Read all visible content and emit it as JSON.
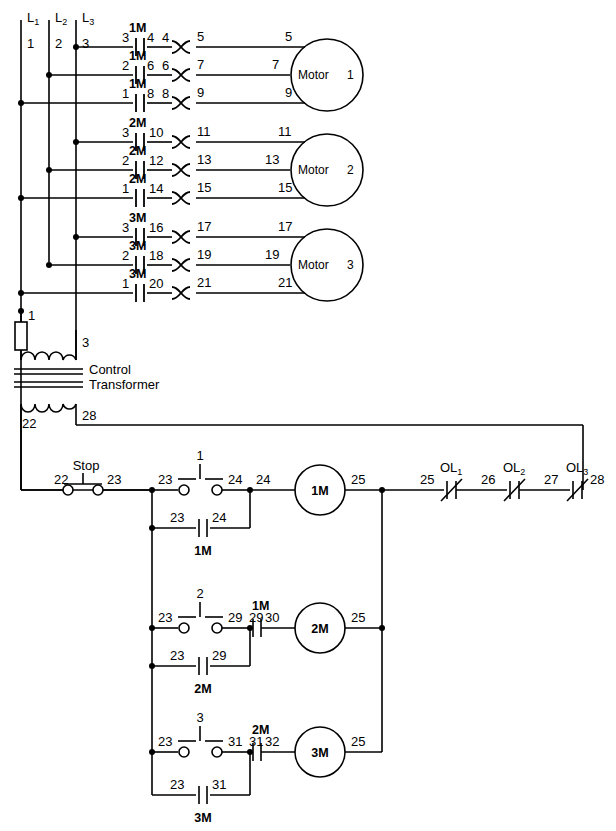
{
  "diagram": {
    "transformer_label_line1": "Control",
    "transformer_label_line2": "Transformer"
  },
  "power": {
    "lines": [
      {
        "name": "L1",
        "base": "L",
        "sub": "1",
        "wire": "1"
      },
      {
        "name": "L2",
        "base": "L",
        "sub": "2",
        "wire": "2"
      },
      {
        "name": "L3",
        "base": "L",
        "sub": "3",
        "wire": "3"
      }
    ],
    "motors": [
      {
        "name": "Motor",
        "number": "1",
        "starter": "1M",
        "phases": [
          {
            "in": "3",
            "contact": "1M",
            "mid_left": "4",
            "mid_right": "4",
            "ol_out": "5",
            "motor_in": "5"
          },
          {
            "in": "2",
            "contact": "1M",
            "mid_left": "6",
            "mid_right": "6",
            "ol_out": "7",
            "motor_in": "7"
          },
          {
            "in": "1",
            "contact": "1M",
            "mid_left": "8",
            "mid_right": "8",
            "ol_out": "9",
            "motor_in": "9"
          }
        ]
      },
      {
        "name": "Motor",
        "number": "2",
        "starter": "2M",
        "phases": [
          {
            "in": "3",
            "contact": "2M",
            "mid_left": "10",
            "mid_right": "",
            "ol_out": "11",
            "motor_in": "11"
          },
          {
            "in": "2",
            "contact": "2M",
            "mid_left": "12",
            "mid_right": "",
            "ol_out": "13",
            "motor_in": "13"
          },
          {
            "in": "1",
            "contact": "2M",
            "mid_left": "14",
            "mid_right": "",
            "ol_out": "15",
            "motor_in": "15"
          }
        ]
      },
      {
        "name": "Motor",
        "number": "3",
        "starter": "3M",
        "phases": [
          {
            "in": "3",
            "contact": "3M",
            "mid_left": "16",
            "mid_right": "",
            "ol_out": "17",
            "motor_in": "17"
          },
          {
            "in": "2",
            "contact": "3M",
            "mid_left": "18",
            "mid_right": "",
            "ol_out": "19",
            "motor_in": "19"
          },
          {
            "in": "1",
            "contact": "3M",
            "mid_left": "20",
            "mid_right": "",
            "ol_out": "21",
            "motor_in": "21"
          }
        ]
      }
    ]
  },
  "transformer": {
    "primary_left_wire": "1",
    "primary_right_wire": "3",
    "secondary_left_wire": "22",
    "secondary_right_wire": "28"
  },
  "control": {
    "stop": {
      "label": "Stop",
      "in": "22",
      "out": "23"
    },
    "rungs": [
      {
        "start_button": "1",
        "start_in": "23",
        "start_out": "24",
        "coil": "1M",
        "coil_in": "24",
        "coil_out": "25",
        "seal_in": "23",
        "seal_out": "24",
        "seal_device": "1M",
        "interlock": null,
        "interlock_in": null,
        "interlock_out": null
      },
      {
        "start_button": "2",
        "start_in": "23",
        "start_out": "29",
        "coil": "2M",
        "coil_in": "30",
        "coil_out": "25",
        "seal_in": "23",
        "seal_out": "29",
        "seal_device": "2M",
        "interlock": "1M",
        "interlock_in": "29",
        "interlock_out": "30"
      },
      {
        "start_button": "3",
        "start_in": "23",
        "start_out": "31",
        "coil": "3M",
        "coil_in": "32",
        "coil_out": "25",
        "seal_in": "23",
        "seal_out": "31",
        "seal_device": "3M",
        "interlock": "2M",
        "interlock_in": "31",
        "interlock_out": "32"
      }
    ],
    "overloads": [
      {
        "base": "OL",
        "sub": "1",
        "in": "25",
        "out": "26"
      },
      {
        "base": "OL",
        "sub": "2",
        "in": "26",
        "out": "27"
      },
      {
        "base": "OL",
        "sub": "3",
        "in": "27",
        "out": "28"
      }
    ],
    "return_wire": "28"
  }
}
